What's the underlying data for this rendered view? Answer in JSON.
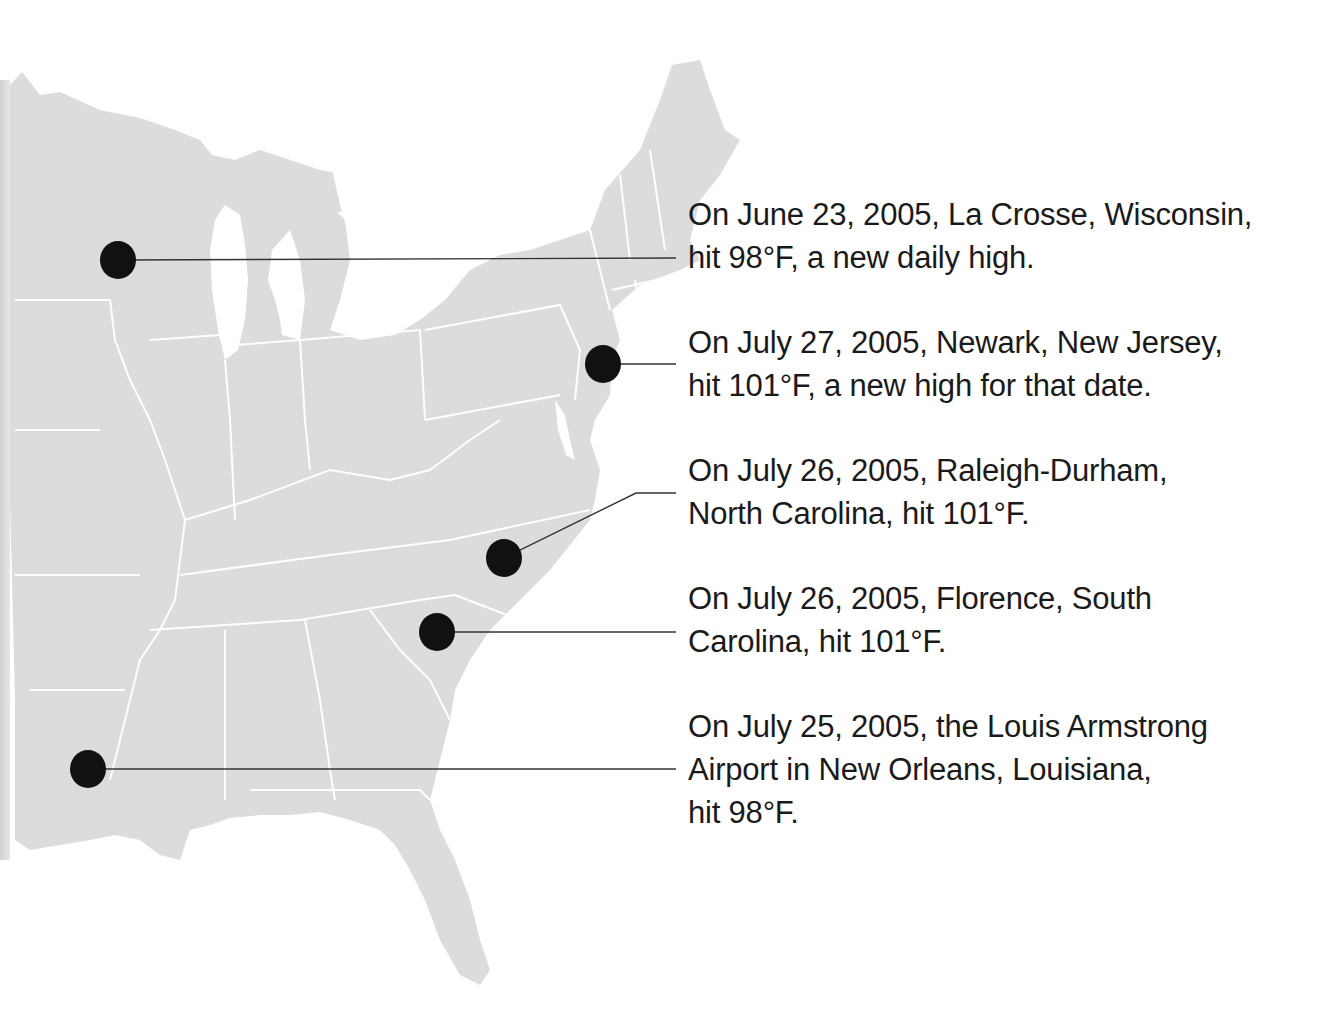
{
  "map": {
    "region": "Eastern United States",
    "land_color": "#dcdcdc",
    "border_color": "#ffffff",
    "marker_color": "#111111",
    "leader_line_color": "#333333"
  },
  "annotations": [
    {
      "id": "la-crosse",
      "location": "La Crosse, Wisconsin",
      "date": "June 23, 2005",
      "temperature": "98°F",
      "lines": [
        "On June 23, 2005, La Crosse, Wisconsin,",
        "hit 98°F, a new daily high."
      ]
    },
    {
      "id": "newark",
      "location": "Newark, New Jersey",
      "date": "July 27, 2005",
      "temperature": "101°F",
      "lines": [
        "On July 27, 2005, Newark, New Jersey,",
        "hit 101°F, a new high for that date."
      ]
    },
    {
      "id": "raleigh-durham",
      "location": "Raleigh-Durham, North Carolina",
      "date": "July 26, 2005",
      "temperature": "101°F",
      "lines": [
        "On July 26, 2005, Raleigh-Durham,",
        "North Carolina, hit 101°F."
      ]
    },
    {
      "id": "florence",
      "location": "Florence, South Carolina",
      "date": "July 26, 2005",
      "temperature": "101°F",
      "lines": [
        "On July 26, 2005, Florence, South",
        "Carolina, hit 101°F."
      ]
    },
    {
      "id": "new-orleans",
      "location": "Louis Armstrong Airport, New Orleans, Louisiana",
      "date": "July 25, 2005",
      "temperature": "98°F",
      "lines": [
        "On July 25, 2005, the Louis Armstrong",
        "Airport in New Orleans, Louisiana,",
        "hit 98°F."
      ]
    }
  ]
}
